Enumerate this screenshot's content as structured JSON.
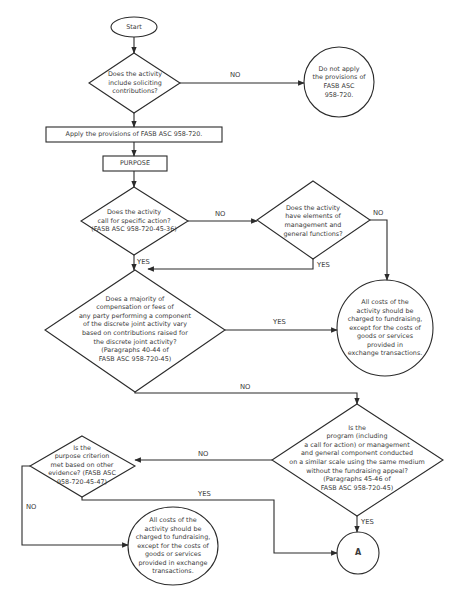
{
  "diagram": {
    "type": "flowchart",
    "stroke_color": "#2b2b2b",
    "text_color": "#3a3a3a",
    "nodes": {
      "start": {
        "shape": "oval",
        "text": "Start"
      },
      "q_soliciting": {
        "shape": "diamond",
        "text": "Does the activity\ninclude  soliciting\ncontributions?"
      },
      "do_not_apply": {
        "shape": "circle",
        "text": "Do not apply\nthe provisions of\nFASB ASC\n958-720."
      },
      "apply": {
        "shape": "rectangle",
        "text": "Apply the provisions of FASB ASC 958-720."
      },
      "purpose": {
        "shape": "rectangle",
        "text": "PURPOSE"
      },
      "q_specific_action": {
        "shape": "diamond",
        "text": "Does the activity\ncall for specific action?\n(FASB ASC 958-720-45-36)"
      },
      "q_mgmt_general": {
        "shape": "diamond",
        "text": "Does the activity\nhave elements of\nmanagement and\ngeneral functions?"
      },
      "all_costs_1": {
        "shape": "circle",
        "text": "All costs of the\nactivity should be\ncharged  to fundraising,\nexcept for the costs of\ngoods or services\nprovided in\nexchange transactions."
      },
      "q_compensation": {
        "shape": "diamond",
        "text": "Does a majority of\ncompensation or fees of\nany party performing a component\nof the discrete joint activity vary\nbased on contributions raised for\nthe discrete joint activity?\n(Paragraphs 40-44 of\nFASB ASC 958-720-45)"
      },
      "q_similar_scale": {
        "shape": "diamond",
        "text": "Is the\nprogram (including\na call for action) or management\nand general component conducted\non a similar scale using the same medium\nwithout the fundraising appeal?\n(Paragraphs 45-46 of\nFASB ASC 958-720-45)"
      },
      "q_other_evidence": {
        "shape": "diamond",
        "text": "Is the\npurpose criterion\nmet based on other\nevidence? (FASB ASC\n958-720-45-47)"
      },
      "all_costs_2": {
        "shape": "ellipse",
        "text": "All costs of the\nactivity should be\ncharged to fundraising,\nexcept for the costs of\ngoods or services\nprovided in exchange\ntransactions."
      },
      "connector_a": {
        "shape": "circle",
        "text": "A"
      }
    },
    "edges": [
      {
        "from": "start",
        "to": "q_soliciting",
        "label": ""
      },
      {
        "from": "q_soliciting",
        "to": "do_not_apply",
        "label": "NO"
      },
      {
        "from": "q_soliciting",
        "to": "apply",
        "label": ""
      },
      {
        "from": "apply",
        "to": "purpose",
        "label": ""
      },
      {
        "from": "purpose",
        "to": "q_specific_action",
        "label": ""
      },
      {
        "from": "q_specific_action",
        "to": "q_mgmt_general",
        "label": "NO"
      },
      {
        "from": "q_specific_action",
        "to": "q_compensation",
        "label": "YES"
      },
      {
        "from": "q_mgmt_general",
        "to": "all_costs_1",
        "label": "NO"
      },
      {
        "from": "q_mgmt_general",
        "to": "q_compensation",
        "label": "YES"
      },
      {
        "from": "q_compensation",
        "to": "all_costs_1",
        "label": "YES"
      },
      {
        "from": "q_compensation",
        "to": "q_similar_scale",
        "label": "NO"
      },
      {
        "from": "q_similar_scale",
        "to": "q_other_evidence",
        "label": "NO"
      },
      {
        "from": "q_similar_scale",
        "to": "connector_a",
        "label": "YES"
      },
      {
        "from": "q_other_evidence",
        "to": "all_costs_2",
        "label": "NO"
      },
      {
        "from": "q_other_evidence",
        "to": "connector_a",
        "label": "YES"
      }
    ],
    "labels": {
      "no_1": "NO",
      "no_2": "NO",
      "no_3": "NO",
      "yes_1": "YES",
      "yes_2": "YES",
      "yes_3": "YES",
      "no_4": "NO",
      "no_5": "NO",
      "no_6": "NO",
      "yes_4": "YES",
      "yes_5": "YES"
    }
  }
}
